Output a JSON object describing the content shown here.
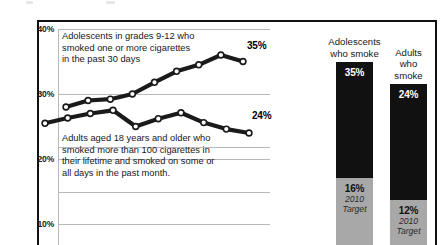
{
  "chart_data": {
    "type": "line",
    "title": "",
    "xlabel": "",
    "ylabel": "",
    "ylim": [
      5,
      40
    ],
    "grid": true,
    "yticks": [
      "40%",
      "30%",
      "20%",
      "10%"
    ],
    "ytick_values": [
      40,
      30,
      20,
      10
    ],
    "legend": "none",
    "series": [
      {
        "name": "Adolescents in grades 9-12 who smoked one or more cigarettes in the past 30 days",
        "end_label": "35%",
        "values": [
          28.0,
          29.0,
          29.2,
          30.0,
          31.8,
          33.5,
          34.5,
          36.0,
          35.0
        ]
      },
      {
        "name": "Adults aged 18 years and older who smoked more than 100 cigarettes in their lifetime and smoked on some or all days in the past month.",
        "end_label": "24%",
        "values": [
          25.5,
          26.3,
          27.0,
          27.5,
          25.0,
          26.2,
          27.1,
          25.6,
          24.6,
          24.0
        ]
      }
    ],
    "bars": [
      {
        "title": "Adolescents\nwho smoke",
        "current_label": "35%",
        "current_value": 35,
        "target_label": "16%",
        "target_value": 16,
        "target_caption": "2010\nTarget"
      },
      {
        "title": "Adults\nwho smoke",
        "current_label": "24%",
        "current_value": 24,
        "target_label": "12%",
        "target_value": 12,
        "target_caption": "2010\nTarget"
      }
    ]
  },
  "captions": {
    "adolescents": "Adolescents in grades 9-12 who\nsmoked one or more cigarettes\nin the past 30 days",
    "adults": "Adults aged 18 years and older who\nsmoked more than 100 cigarettes in\ntheir lifetime and smoked on some or\nall days in the past month."
  },
  "colors": {
    "line": "#1a1a1a",
    "grid": "#b9b9bd",
    "frame": "#111111",
    "bar_dark": "#111111",
    "bar_gray": "#a8a8a8"
  }
}
